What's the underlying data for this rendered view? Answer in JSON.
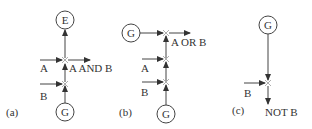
{
  "diagram": {
    "panels": [
      {
        "id": "a",
        "caption": "(a)",
        "output_node": "E",
        "source_node": "G",
        "inputs": [
          "A",
          "B"
        ],
        "result_label": "A AND B"
      },
      {
        "id": "b",
        "caption": "(b)",
        "top_source_node": "G",
        "source_node": "G",
        "inputs": [
          "A",
          "B"
        ],
        "result_label": "A OR B"
      },
      {
        "id": "c",
        "caption": "(c)",
        "source_node": "G",
        "inputs": [
          "B"
        ],
        "result_label": "NOT B"
      }
    ]
  }
}
